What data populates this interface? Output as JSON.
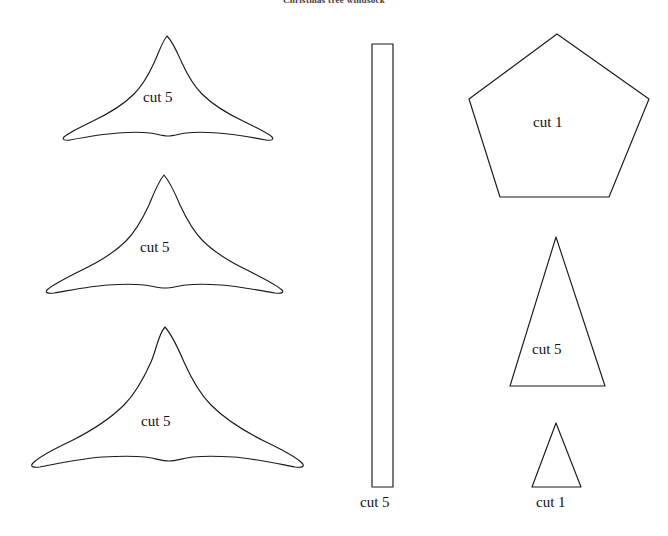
{
  "document": {
    "title": "Christmas tree windsock",
    "background_color": "#ffffff",
    "stroke_color": "#1a1a1a",
    "text_color": "#111111",
    "width": 668,
    "height": 536
  },
  "pieces": [
    {
      "id": "tree-tier-small",
      "shape_name": "tree-tier-shape",
      "label": "cut 5",
      "quantity": 5,
      "label_position": "inside"
    },
    {
      "id": "tree-tier-medium",
      "shape_name": "tree-tier-shape",
      "label": "cut 5",
      "quantity": 5,
      "label_position": "inside"
    },
    {
      "id": "tree-tier-large",
      "shape_name": "tree-tier-shape",
      "label": "cut 5",
      "quantity": 5,
      "label_position": "inside"
    },
    {
      "id": "strip",
      "shape_name": "rectangle-strip",
      "label": "cut 5",
      "quantity": 5,
      "label_position": "below"
    },
    {
      "id": "pentagon-base",
      "shape_name": "pentagon",
      "label": "cut 1",
      "quantity": 1,
      "label_position": "inside"
    },
    {
      "id": "triangle-large",
      "shape_name": "triangle",
      "label": "cut 5",
      "quantity": 5,
      "label_position": "inside"
    },
    {
      "id": "triangle-small",
      "shape_name": "triangle",
      "label": "cut 1",
      "quantity": 1,
      "label_position": "below"
    }
  ]
}
